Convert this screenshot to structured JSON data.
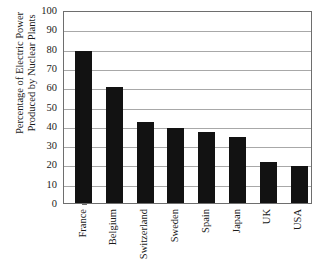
{
  "chart_data": {
    "type": "bar",
    "title": "",
    "subtitle": "",
    "xlabel": "",
    "ylabel": "Percentage of Electric Power Produced by Nuclear Plants",
    "ylabel_lines": [
      "Percentage of Electric Power",
      "Produced by Nuclear Plants"
    ],
    "categories": [
      "France",
      "Belgium",
      "Switzerland",
      "Sweden",
      "Spain",
      "Japan",
      "UK",
      "USA"
    ],
    "values": [
      79,
      60,
      42,
      39,
      37,
      34,
      21,
      19
    ],
    "ylim": [
      0,
      100
    ],
    "ytick_step": 10,
    "yticks": [
      0,
      10,
      20,
      30,
      40,
      50,
      60,
      70,
      80,
      90,
      100
    ],
    "ytick_labels": [
      "0",
      "10",
      "20",
      "30",
      "40",
      "50",
      "60",
      "70",
      "80",
      "90",
      "100"
    ],
    "grid": true,
    "grid_axis": "y",
    "legend": false,
    "legend_position": "none",
    "bar_color": "#121212",
    "grid_color": "#a8a8a8",
    "axis_color": "#6e6e6e",
    "background_color": "#ffffff",
    "xtick_label_rotation": -90
  }
}
